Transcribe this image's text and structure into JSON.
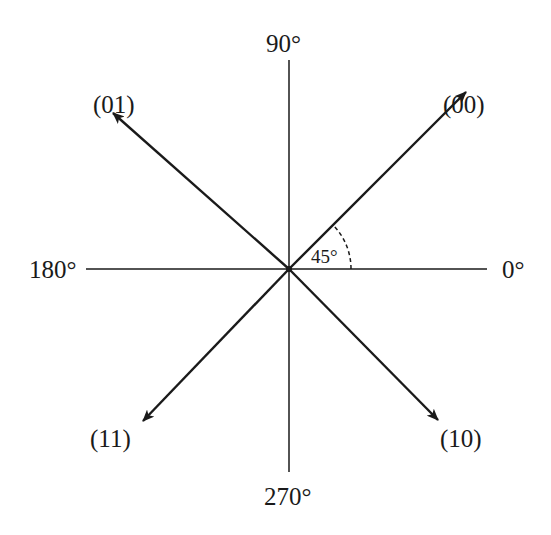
{
  "figure": {
    "title": "",
    "colors": {
      "line": "#1a1a1a",
      "background": "#ffffff"
    },
    "center": [
      289,
      269
    ],
    "axes": {
      "labels": {
        "deg0": "0°",
        "deg90": "90°",
        "deg180": "180°",
        "deg270": "270°"
      }
    },
    "vectors": [
      {
        "label": "(00)",
        "angle_deg": 45
      },
      {
        "label": "(01)",
        "angle_deg": 135
      },
      {
        "label": "(11)",
        "angle_deg": 225
      },
      {
        "label": "(10)",
        "angle_deg": 315
      }
    ],
    "angle_marker": {
      "label": "45°",
      "from_deg": 0,
      "to_deg": 45,
      "style": "dashed arc"
    }
  }
}
